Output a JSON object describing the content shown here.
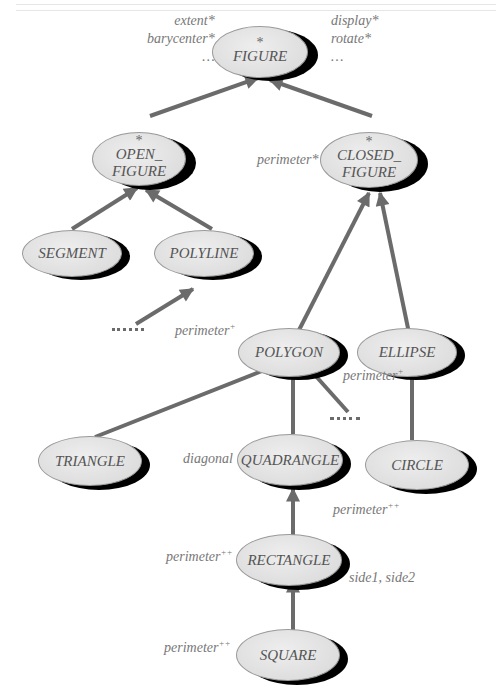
{
  "diagram": {
    "type": "inheritance-hierarchy",
    "colors": {
      "node_fill": "#dedede",
      "node_shadow": "#000000",
      "arrow": "#6b6b6b",
      "text": "#555555"
    },
    "nodes": [
      {
        "id": "figure",
        "label": "FIGURE",
        "deferred_marker": "*"
      },
      {
        "id": "open_figure",
        "label_line1": "OPEN_",
        "label_line2": "FIGURE",
        "deferred_marker": "*"
      },
      {
        "id": "closed_figure",
        "label_line1": "CLOSED_",
        "label_line2": "FIGURE",
        "deferred_marker": "*"
      },
      {
        "id": "segment",
        "label": "SEGMENT"
      },
      {
        "id": "polyline",
        "label": "POLYLINE"
      },
      {
        "id": "polygon",
        "label": "POLYGON"
      },
      {
        "id": "ellipse",
        "label": "ELLIPSE"
      },
      {
        "id": "triangle",
        "label": "TRIANGLE"
      },
      {
        "id": "quadrangle",
        "label": "QUADRANGLE"
      },
      {
        "id": "circle",
        "label": "CIRCLE"
      },
      {
        "id": "rectangle",
        "label": "RECTANGLE"
      },
      {
        "id": "square",
        "label": "SQUARE"
      }
    ],
    "features": {
      "figure_left": [
        "extent*",
        "barycenter*",
        "…"
      ],
      "figure_right": [
        "display*",
        "rotate*",
        "…"
      ],
      "closed_figure": "perimeter*",
      "polygon": {
        "name": "perimeter",
        "mark": "+"
      },
      "ellipse": {
        "name": "perimeter",
        "mark": "+"
      },
      "quadrangle": "diagonal",
      "circle": {
        "name": "perimeter",
        "mark": "++"
      },
      "rectangle_left": {
        "name": "perimeter",
        "mark": "++"
      },
      "rectangle_right": "side1, side2",
      "square": {
        "name": "perimeter",
        "mark": "++"
      }
    },
    "edges": [
      {
        "from": "open_figure",
        "to": "figure"
      },
      {
        "from": "closed_figure",
        "to": "figure"
      },
      {
        "from": "segment",
        "to": "open_figure"
      },
      {
        "from": "polyline",
        "to": "open_figure"
      },
      {
        "from": "more_open",
        "to": "polyline"
      },
      {
        "from": "polygon",
        "to": "closed_figure"
      },
      {
        "from": "ellipse",
        "to": "closed_figure"
      },
      {
        "from": "triangle",
        "to": "polygon"
      },
      {
        "from": "quadrangle",
        "to": "polygon"
      },
      {
        "from": "more_polygons",
        "to": "polygon"
      },
      {
        "from": "circle",
        "to": "ellipse"
      },
      {
        "from": "rectangle",
        "to": "quadrangle"
      },
      {
        "from": "square",
        "to": "rectangle"
      }
    ]
  }
}
